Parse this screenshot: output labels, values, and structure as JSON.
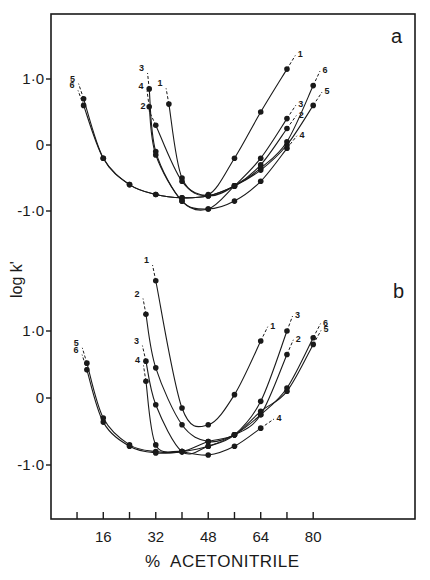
{
  "figure": {
    "panel_a_label": "a",
    "panel_b_label": "b",
    "xlabel": "%  ACETONITRILE",
    "ylabel": "log k'",
    "x_ticks": [
      "16",
      "32",
      "48",
      "64",
      "80"
    ],
    "y_ticks_a": [
      "1·0",
      "0",
      "-1·0"
    ],
    "y_ticks_b": [
      "1·0",
      "0",
      "-1·0"
    ],
    "colors": {
      "ink": "#1a1a1a",
      "background": "#ffffff"
    }
  },
  "chart_data": [
    {
      "type": "line",
      "panel": "a",
      "title": "a",
      "xlabel": "% ACETONITRILE",
      "ylabel": "log k'",
      "xlim": [
        0,
        112
      ],
      "ylim": [
        -1.75,
        1.95
      ],
      "x_ticks": [
        8,
        16,
        24,
        32,
        40,
        48,
        56,
        64,
        72,
        80
      ],
      "x_tick_labels": [
        "16",
        "32",
        "48",
        "64",
        "80"
      ],
      "y_ticks": [
        -1.0,
        0,
        1.0
      ],
      "grid": false,
      "legend": "curve numbers 1-6 labeled at curve ends",
      "series": [
        {
          "name": "1",
          "x": [
            36,
            40,
            48,
            56,
            64,
            72
          ],
          "y": [
            0.62,
            -0.5,
            -0.75,
            -0.2,
            0.5,
            1.15
          ]
        },
        {
          "name": "2",
          "x": [
            32,
            40,
            48,
            56,
            64,
            72
          ],
          "y": [
            0.3,
            -0.55,
            -0.77,
            -0.62,
            -0.3,
            0.25
          ]
        },
        {
          "name": "3",
          "x": [
            30,
            32,
            40,
            48,
            56,
            64,
            72
          ],
          "y": [
            0.85,
            -0.1,
            -0.85,
            -0.97,
            -0.62,
            -0.2,
            0.4
          ]
        },
        {
          "name": "4",
          "x": [
            30,
            32,
            40,
            48,
            56,
            64,
            72
          ],
          "y": [
            0.58,
            -0.15,
            -0.85,
            -0.97,
            -0.85,
            -0.55,
            -0.05
          ]
        },
        {
          "name": "5",
          "x": [
            10,
            16,
            24,
            32,
            40,
            48,
            56,
            64,
            72,
            80
          ],
          "y": [
            0.7,
            -0.2,
            -0.6,
            -0.75,
            -0.8,
            -0.77,
            -0.62,
            -0.38,
            0.0,
            0.6
          ]
        },
        {
          "name": "6",
          "x": [
            10,
            16,
            24,
            32,
            40,
            48,
            56,
            64,
            72,
            80
          ],
          "y": [
            0.6,
            -0.2,
            -0.6,
            -0.75,
            -0.8,
            -0.77,
            -0.62,
            -0.35,
            0.05,
            0.9
          ]
        }
      ]
    },
    {
      "type": "line",
      "panel": "b",
      "title": "b",
      "xlabel": "% ACETONITRILE",
      "ylabel": "log k'",
      "xlim": [
        0,
        112
      ],
      "ylim": [
        -1.8,
        2.3
      ],
      "x_ticks": [
        8,
        16,
        24,
        32,
        40,
        48,
        56,
        64,
        72,
        80
      ],
      "x_tick_labels": [
        "16",
        "32",
        "48",
        "64",
        "80"
      ],
      "y_ticks": [
        -1.0,
        0,
        1.0
      ],
      "grid": false,
      "legend": "curve numbers 1-6 labeled at curve ends",
      "series": [
        {
          "name": "1",
          "x": [
            32,
            40,
            48,
            56,
            64
          ],
          "y": [
            1.75,
            -0.15,
            -0.4,
            0.05,
            0.85
          ]
        },
        {
          "name": "2",
          "x": [
            29,
            32,
            40,
            48,
            56,
            64,
            72
          ],
          "y": [
            1.25,
            0.45,
            -0.4,
            -0.65,
            -0.55,
            -0.25,
            0.65
          ]
        },
        {
          "name": "3",
          "x": [
            29,
            32,
            40,
            48,
            56,
            64,
            72
          ],
          "y": [
            0.55,
            -0.1,
            -0.8,
            -0.72,
            -0.55,
            -0.05,
            1.0
          ]
        },
        {
          "name": "4",
          "x": [
            29,
            32,
            40,
            48,
            56,
            64
          ],
          "y": [
            0.25,
            -0.7,
            -0.8,
            -0.85,
            -0.72,
            -0.45
          ]
        },
        {
          "name": "5",
          "x": [
            11,
            16,
            24,
            32,
            40,
            48,
            56,
            64,
            72,
            80
          ],
          "y": [
            0.52,
            -0.3,
            -0.7,
            -0.8,
            -0.8,
            -0.65,
            -0.55,
            -0.2,
            0.1,
            0.8
          ]
        },
        {
          "name": "6",
          "x": [
            11,
            16,
            24,
            32,
            40,
            48,
            56,
            64,
            72,
            80
          ],
          "y": [
            0.42,
            -0.36,
            -0.72,
            -0.82,
            -0.8,
            -0.72,
            -0.55,
            -0.25,
            0.15,
            0.9
          ]
        }
      ]
    }
  ]
}
